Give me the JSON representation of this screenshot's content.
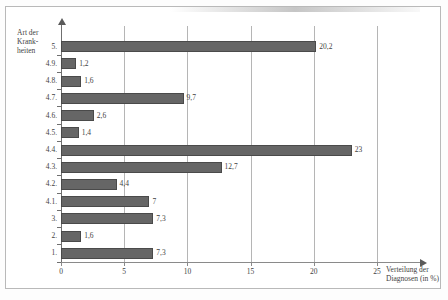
{
  "chart_data": {
    "type": "bar",
    "orientation": "horizontal",
    "title": "",
    "xlabel": "Verteilung der Diagnosen (in %)",
    "ylabel": "Art der Krank-heiten",
    "ylabel_line1": "Art der Krank-",
    "ylabel_line2": "heiten",
    "xlim": [
      0,
      25
    ],
    "xticks": [
      0,
      5,
      10,
      15,
      20,
      25
    ],
    "xtick_labels": [
      "0",
      "5",
      "10",
      "15",
      "20",
      "25"
    ],
    "grid": "vertical",
    "legend": "none",
    "bar_color": "#666666",
    "categories": [
      "5.",
      "4.9.",
      "4.8.",
      "4.7.",
      "4.6.",
      "4.5.",
      "4.4.",
      "4.3.",
      "4.2.",
      "4.1.",
      "3.",
      "2.",
      "1."
    ],
    "values": [
      20.2,
      1.2,
      1.6,
      9.7,
      2.6,
      1.4,
      23,
      12.7,
      4.4,
      7,
      7.3,
      1.6,
      7.3
    ],
    "value_labels": [
      "20,2",
      "1,2",
      "1,6",
      "9,7",
      "2,6",
      "1,4",
      "23",
      "12,7",
      "4,4",
      "7",
      "7,3",
      "1,6",
      "7,3"
    ]
  }
}
